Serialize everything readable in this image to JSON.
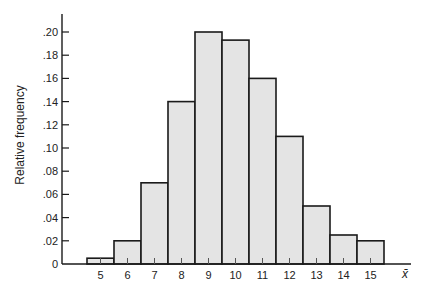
{
  "chart_data": {
    "type": "bar",
    "title": "",
    "xlabel": "x̄",
    "ylabel": "Relative frequency",
    "categories": [
      "5",
      "6",
      "7",
      "8",
      "9",
      "10",
      "11",
      "12",
      "13",
      "14",
      "15"
    ],
    "values": [
      0.005,
      0.02,
      0.07,
      0.14,
      0.2,
      0.193,
      0.16,
      0.11,
      0.05,
      0.025,
      0.02
    ],
    "ylim": [
      0,
      0.21
    ],
    "yticks": [
      0,
      0.02,
      0.04,
      0.06,
      0.08,
      0.1,
      0.12,
      0.14,
      0.16,
      0.18,
      0.2
    ],
    "ytick_labels": [
      "0",
      ".02",
      ".04",
      ".06",
      ".08",
      ".10",
      ".12",
      ".14",
      ".16",
      ".18",
      ".20"
    ],
    "xtick_labels": [
      "5",
      "6",
      "7",
      "8",
      "9",
      "10",
      "11",
      "12",
      "13",
      "14",
      "15"
    ],
    "grid": false,
    "legend": null,
    "histogram": true
  },
  "colors": {
    "bar_fill": "#e4e4e4",
    "bar_stroke": "#1a1a1a",
    "axis": "#1a1a1a",
    "background": "#ffffff"
  }
}
